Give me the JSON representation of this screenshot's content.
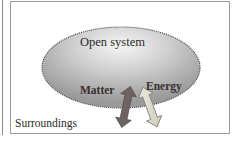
{
  "diagram": {
    "title": "Open system",
    "system_label": "Open system",
    "surroundings_label": "Surroundings",
    "exchanges": [
      {
        "label": "Matter",
        "direction": "bidirectional",
        "style": "solid",
        "color": "#6e6262"
      },
      {
        "label": "Energy",
        "direction": "bidirectional",
        "style": "outlined",
        "color": "#d8d4c8"
      }
    ],
    "colors": {
      "frame": "#9a9a9a",
      "system_fill_light": "#f2f2f2",
      "system_fill_dark": "#9e9e9e",
      "system_outline": "#555555",
      "text": "#2b2b2b"
    }
  }
}
